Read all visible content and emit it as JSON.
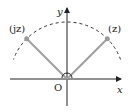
{
  "diagram": {
    "axes": {
      "x_label": "x",
      "y_label": "y",
      "origin_label": "O"
    },
    "points": [
      {
        "id": "z",
        "label": "(z)",
        "angle_deg": 45
      },
      {
        "id": "jz",
        "label": "(jz)",
        "angle_deg": 135
      }
    ],
    "arc": {
      "style": "dashed",
      "from_deg": 20,
      "to_deg": 160
    },
    "colors": {
      "axis": "#222222",
      "vector": "#a0a0a0",
      "point": "#999999",
      "arc": "#333333"
    }
  }
}
